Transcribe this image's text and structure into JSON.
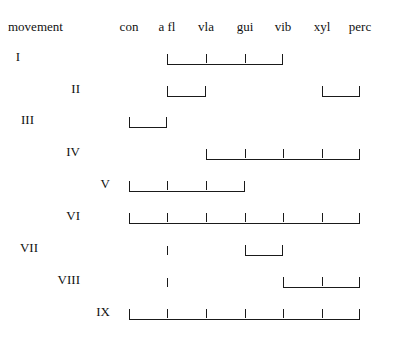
{
  "page": {
    "width": 397,
    "height": 341,
    "background": "#ffffff",
    "ink": "#1a1a1a"
  },
  "header": {
    "corner_label": "movement",
    "columns": [
      {
        "key": "con",
        "label": "con",
        "x": 129
      },
      {
        "key": "afl",
        "label": "a fl",
        "x": 167
      },
      {
        "key": "vla",
        "label": "vla",
        "x": 206
      },
      {
        "key": "gui",
        "label": "gui",
        "x": 245
      },
      {
        "key": "vib",
        "label": "vib",
        "x": 283
      },
      {
        "key": "xyl",
        "label": "xyl",
        "x": 322
      },
      {
        "key": "perc",
        "label": "perc",
        "x": 360
      }
    ]
  },
  "chart_data": {
    "type": "table",
    "title": "",
    "xlabel": "",
    "ylabel": "movement",
    "categories": [
      "con",
      "a fl",
      "vla",
      "gui",
      "vib",
      "xyl",
      "perc"
    ],
    "rows": [
      {
        "label": "I",
        "label_x": 20,
        "y": 47,
        "spans": [
          {
            "from": "a fl",
            "to": "vib",
            "ticks": [
              "vla",
              "gui"
            ]
          }
        ],
        "points": []
      },
      {
        "label": "II",
        "label_x": 80,
        "y": 79,
        "spans": [
          {
            "from": "a fl",
            "to": "vla",
            "ticks": []
          },
          {
            "from": "xyl",
            "to": "perc",
            "ticks": []
          }
        ],
        "points": []
      },
      {
        "label": "III",
        "label_x": 34,
        "y": 110,
        "spans": [
          {
            "from": "con",
            "to": "a fl",
            "ticks": []
          }
        ],
        "points": []
      },
      {
        "label": "IV",
        "label_x": 80,
        "y": 142,
        "spans": [
          {
            "from": "vla",
            "to": "perc",
            "ticks": [
              "gui",
              "vib",
              "xyl"
            ]
          }
        ],
        "points": []
      },
      {
        "label": "V",
        "label_x": 110,
        "y": 174,
        "spans": [
          {
            "from": "con",
            "to": "gui",
            "ticks": [
              "a fl",
              "vla"
            ]
          }
        ],
        "points": []
      },
      {
        "label": "VI",
        "label_x": 80,
        "y": 206,
        "spans": [
          {
            "from": "con",
            "to": "perc",
            "ticks": [
              "a fl",
              "vla",
              "gui",
              "vib",
              "xyl"
            ]
          }
        ],
        "points": []
      },
      {
        "label": "VII",
        "label_x": 38,
        "y": 238,
        "spans": [
          {
            "from": "gui",
            "to": "vib",
            "ticks": []
          }
        ],
        "points": [
          "a fl"
        ]
      },
      {
        "label": "VIII",
        "label_x": 80,
        "y": 270,
        "spans": [
          {
            "from": "vib",
            "to": "perc",
            "ticks": [
              "xyl"
            ]
          }
        ],
        "points": [
          "a fl"
        ]
      },
      {
        "label": "IX",
        "label_x": 110,
        "y": 302,
        "spans": [
          {
            "from": "con",
            "to": "perc",
            "ticks": [
              "a fl",
              "vla",
              "gui",
              "vib",
              "xyl"
            ]
          }
        ],
        "points": []
      }
    ]
  }
}
